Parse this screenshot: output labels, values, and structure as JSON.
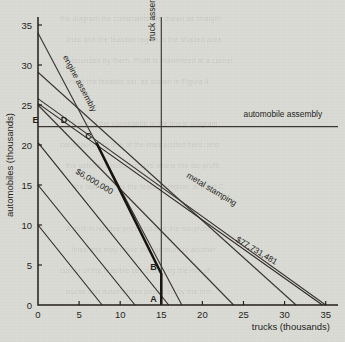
{
  "chart_data": {
    "type": "line",
    "title": "",
    "xlabel": "trucks (thousands)",
    "ylabel": "automobiles (thousands)",
    "xlim": [
      0,
      36.5
    ],
    "ylim": [
      0,
      36.0
    ],
    "xticks": [
      0,
      5,
      10,
      15,
      20,
      25,
      30,
      35
    ],
    "yticks": [
      0,
      5,
      10,
      15,
      20,
      25,
      30,
      35
    ],
    "grid": false,
    "legend_position": "inline-labels",
    "series": [
      {
        "name": "engine assembly",
        "kind": "constraint",
        "label": "engine assembly",
        "points": [
          [
            0,
            34.0
          ],
          [
            17.5,
            0.0
          ]
        ]
      },
      {
        "name": "truck assembly",
        "kind": "constraint",
        "label": "truck assembly",
        "points": [
          [
            15.0,
            36.0
          ],
          [
            15.0,
            0.0
          ]
        ]
      },
      {
        "name": "automobile assembly",
        "kind": "constraint",
        "label": "automobile assembly",
        "points": [
          [
            0,
            22.3
          ],
          [
            36.5,
            22.3
          ]
        ]
      },
      {
        "name": "metal stamping",
        "kind": "constraint",
        "label": "metal stamping",
        "points": [
          [
            0,
            25.8
          ],
          [
            35.0,
            0.0
          ]
        ]
      },
      {
        "name": "constraint-4",
        "kind": "constraint",
        "label": "",
        "points": [
          [
            0,
            29.1
          ],
          [
            31.4,
            0.0
          ]
        ]
      },
      {
        "name": "constraint-5",
        "kind": "constraint",
        "label": "",
        "points": [
          [
            0,
            25.0
          ],
          [
            23.8,
            0.0
          ]
        ]
      },
      {
        "name": "isoprofit-6000000",
        "kind": "isoprofit",
        "label": "$6,000,000",
        "value": "$6,000,000",
        "points": [
          [
            0,
            20.3
          ],
          [
            15.9,
            0.0
          ]
        ]
      },
      {
        "name": "isoprofit-low-a",
        "kind": "isoprofit",
        "label": "",
        "points": [
          [
            0,
            15.0
          ],
          [
            11.8,
            0.0
          ]
        ]
      },
      {
        "name": "isoprofit-low-b",
        "kind": "isoprofit",
        "label": "",
        "points": [
          [
            0,
            10.0
          ],
          [
            7.8,
            0.0
          ]
        ]
      },
      {
        "name": "isoprofit-77731481",
        "kind": "isoprofit",
        "label": "$77,731,481",
        "value": "$77,731,481",
        "points": [
          [
            0,
            25.2
          ],
          [
            34.6,
            0.0
          ]
        ]
      },
      {
        "name": "feasible-frontier",
        "kind": "frontier",
        "label": "",
        "points": [
          [
            7.1,
            20.3
          ],
          [
            15.0,
            3.9
          ],
          [
            15.0,
            0.0
          ]
        ]
      }
    ],
    "points": [
      {
        "label": "A",
        "x": 15.0,
        "y": 0.0
      },
      {
        "label": "B",
        "x": 15.0,
        "y": 3.9
      },
      {
        "label": "C",
        "x": 7.1,
        "y": 20.3
      },
      {
        "label": "D",
        "x": 4.1,
        "y": 22.3
      },
      {
        "label": "E",
        "x": 0.6,
        "y": 22.3
      }
    ],
    "annotations": [
      {
        "text": "engine assembly",
        "x": 3.0,
        "y": 31.0,
        "rotation": 62
      },
      {
        "text": "truck assembly",
        "x": 14.2,
        "y": 33.0,
        "rotation": -90
      },
      {
        "text": "automobile assembly",
        "x": 25.0,
        "y": 23.5,
        "rotation": 0
      },
      {
        "text": "metal stamping",
        "x": 18.0,
        "y": 16.0,
        "rotation": 31
      },
      {
        "text": "$6,000,000",
        "x": 4.5,
        "y": 16.5,
        "rotation": 31
      },
      {
        "text": "$77,731,481",
        "x": 24.0,
        "y": 8.0,
        "rotation": 31
      }
    ]
  },
  "axes": {
    "x_label": "trucks (thousands)",
    "y_label": "automobiles (thousands)",
    "x_ticks": [
      "0",
      "5",
      "10",
      "15",
      "20",
      "25",
      "30",
      "35"
    ],
    "y_ticks": [
      "0",
      "5",
      "10",
      "15",
      "20",
      "25",
      "30",
      "35"
    ]
  },
  "labels": {
    "engine_assembly": "engine assembly",
    "truck_assembly": "truck assembly",
    "automobile_assembly": "automobile assembly",
    "metal_stamping": "metal stamping",
    "iso_low": "$6,000,000",
    "iso_high": "$77,731,481",
    "point_a": "A",
    "point_b": "B",
    "point_c": "C",
    "point_d": "D",
    "point_e": "E"
  },
  "background_text": {
    "lines": [
      "the diagram the constraints are drawn as straight",
      "lines and the feasible region is the shaded area",
      "bounded by them. Profit is maximized at a corner",
      "point of the feasible set, as shown in Figure 4.",
      "",
      "Each of the constraints in the linear program",
      "corresponds to one of the lines plotted here, and",
      "the optimal solution occurs where the iso-profit",
      "line last touches the feasible region, at point C.",
      "",
      "A shift in relative prices rotates the iso-profit",
      "lines and may move the optimum to another",
      "corner of the feasible set, changing the mix of",
      "trucks and automobiles produced by the firm."
    ]
  }
}
